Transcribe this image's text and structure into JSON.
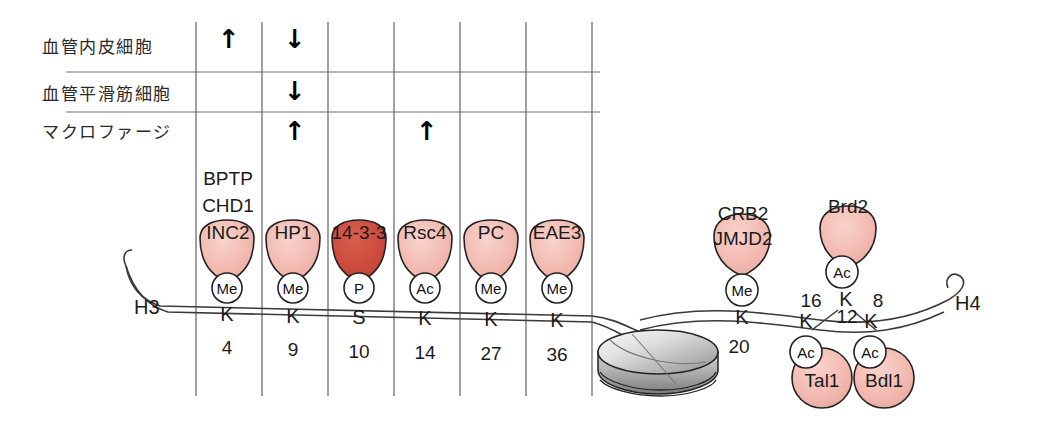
{
  "figure": {
    "type": "histone-modification-diagram",
    "colors": {
      "protein_pink": "#f2b9b0",
      "protein_dark_red": "#cc4b3c",
      "nucleosome_gray": "#c9c9c9",
      "line": "#3a3a3a",
      "grid": "#6e6e6e"
    }
  },
  "table": {
    "rows": [
      {
        "label": "血管内皮細胞",
        "marks": [
          {
            "col": 0,
            "glyph": "↑"
          },
          {
            "col": 1,
            "glyph": "↓"
          }
        ]
      },
      {
        "label": "血管平滑筋細胞",
        "marks": [
          {
            "col": 1,
            "glyph": "↓"
          }
        ]
      },
      {
        "label": "マクロファージ",
        "marks": [
          {
            "col": 1,
            "glyph": "↑"
          },
          {
            "col": 3,
            "glyph": "↑"
          }
        ]
      }
    ]
  },
  "h3": {
    "tail_label": "H3",
    "residues": [
      {
        "letter": "K",
        "number": "4",
        "badge": "Me",
        "readers": [
          "BPTP",
          "CHD1",
          "INC2"
        ],
        "highlight": false
      },
      {
        "letter": "K",
        "number": "9",
        "badge": "Me",
        "readers": [
          "HP1"
        ],
        "highlight": false
      },
      {
        "letter": "S",
        "number": "10",
        "badge": "P",
        "readers": [
          "14-3-3"
        ],
        "highlight": true
      },
      {
        "letter": "K",
        "number": "14",
        "badge": "Ac",
        "readers": [
          "Rsc4"
        ],
        "highlight": false
      },
      {
        "letter": "K",
        "number": "27",
        "badge": "Me",
        "readers": [
          "PC"
        ],
        "highlight": false
      },
      {
        "letter": "K",
        "number": "36",
        "badge": "Me",
        "readers": [
          "EAE3"
        ],
        "highlight": false
      }
    ]
  },
  "h4": {
    "tail_label": "H4",
    "k20": {
      "letter": "K",
      "number": "20",
      "badge": "Me",
      "readers": [
        "CRB2",
        "JMJD2"
      ]
    },
    "k16": {
      "letter": "K",
      "number": "16",
      "badge": "Ac",
      "reader": "Brd2"
    },
    "k12": {
      "letter": "K",
      "number": "12",
      "badge": "Ac",
      "reader": "Tal1"
    },
    "k8": {
      "letter": "K",
      "number": "8",
      "badge": "Ac",
      "reader": "Bdl1"
    }
  },
  "nucleosome": {
    "name": "nucleosome-core-particle"
  }
}
